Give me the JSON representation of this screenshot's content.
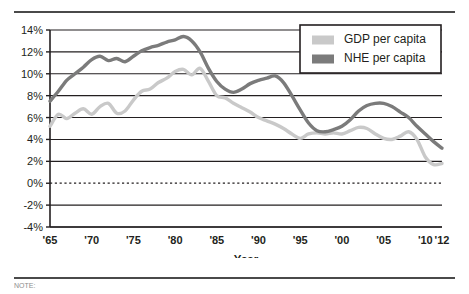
{
  "figure": {
    "note_text": "NOTE:"
  },
  "chart_data": {
    "type": "line",
    "title": "",
    "xlabel": "Year",
    "ylabel": "",
    "xlim": [
      1965,
      2012
    ],
    "ylim": [
      -4,
      14
    ],
    "grid": true,
    "legend_position": "top-right",
    "y_ticks": [
      14,
      12,
      10,
      8,
      6,
      4,
      2,
      0,
      -2,
      -4
    ],
    "y_tick_labels": [
      "14%",
      "12%",
      "10%",
      "8%",
      "6%",
      "4%",
      "2%",
      "0%",
      "-2%",
      "-4%"
    ],
    "x_ticks": [
      1965,
      1970,
      1975,
      1980,
      1985,
      1990,
      1995,
      2000,
      2005,
      2010,
      2012
    ],
    "x_tick_labels": [
      "'65",
      "'70",
      "'75",
      "'80",
      "'85",
      "'90",
      "'95",
      "'00",
      "'05",
      "'10",
      "'12"
    ],
    "zero_line": 0,
    "x": [
      1965,
      1966,
      1967,
      1968,
      1969,
      1970,
      1971,
      1972,
      1973,
      1974,
      1975,
      1976,
      1977,
      1978,
      1979,
      1980,
      1981,
      1982,
      1983,
      1984,
      1985,
      1986,
      1987,
      1988,
      1989,
      1990,
      1991,
      1992,
      1993,
      1994,
      1995,
      1996,
      1997,
      1998,
      1999,
      2000,
      2001,
      2002,
      2003,
      2004,
      2005,
      2006,
      2007,
      2008,
      2009,
      2010,
      2011,
      2012
    ],
    "series": [
      {
        "name": "GDP per capita",
        "color": "#c9c9c9",
        "values": [
          5.2,
          6.3,
          5.9,
          6.4,
          6.8,
          6.3,
          7.0,
          7.3,
          6.4,
          6.6,
          7.6,
          8.4,
          8.6,
          9.2,
          9.6,
          10.2,
          10.4,
          9.9,
          10.5,
          9.3,
          8.0,
          7.8,
          7.3,
          6.9,
          6.5,
          6.0,
          5.7,
          5.4,
          5.0,
          4.5,
          4.1,
          4.5,
          4.6,
          4.5,
          4.6,
          4.5,
          4.8,
          5.1,
          5.0,
          4.5,
          4.1,
          4.0,
          4.3,
          4.7,
          4.0,
          2.4,
          1.7,
          1.8
        ]
      },
      {
        "name": "NHE per capita",
        "color": "#7b7b7b",
        "values": [
          7.5,
          8.4,
          9.4,
          10.0,
          10.6,
          11.3,
          11.6,
          11.2,
          11.4,
          11.1,
          11.6,
          12.1,
          12.4,
          12.6,
          12.9,
          13.1,
          13.4,
          13.0,
          12.0,
          10.5,
          9.3,
          8.6,
          8.3,
          8.6,
          9.1,
          9.4,
          9.6,
          9.8,
          9.2,
          8.0,
          6.7,
          5.5,
          4.8,
          4.7,
          4.9,
          5.2,
          5.8,
          6.6,
          7.1,
          7.3,
          7.3,
          7.0,
          6.5,
          6.0,
          5.2,
          4.5,
          3.8,
          3.2
        ]
      }
    ]
  }
}
